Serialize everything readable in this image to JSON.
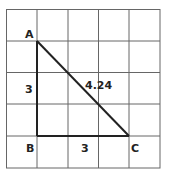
{
  "diagram": {
    "grid": {
      "columns": 5,
      "rows": 5,
      "line_color": "#555555"
    },
    "triangle": {
      "vertices": {
        "A": "A",
        "B": "B",
        "C": "C"
      },
      "side_labels": {
        "AB": "3",
        "BC": "3",
        "AC": "4.24"
      },
      "stroke_color": "#222222"
    }
  }
}
